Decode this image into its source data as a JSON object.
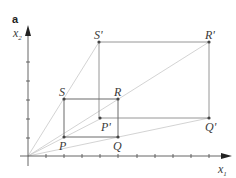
{
  "panel_label": "a",
  "axes": {
    "x_label": "x",
    "x_sub": "1",
    "y_label": "x",
    "y_sub": "2",
    "origin_px": [
      28,
      156
    ],
    "tick_spacing_px": 18.2,
    "x_ticks": 10,
    "y_ticks": 5
  },
  "colors": {
    "axis": "#555555",
    "rect": "#777777",
    "ray": "#c8c8c8",
    "point": "#444444",
    "label": "#3a3a3a"
  },
  "original_rectangle": {
    "points": [
      {
        "name": "P",
        "x": 2,
        "y": 1,
        "label": "P"
      },
      {
        "name": "Q",
        "x": 5,
        "y": 1,
        "label": "Q"
      },
      {
        "name": "R",
        "x": 5,
        "y": 3,
        "label": "R"
      },
      {
        "name": "S",
        "x": 2,
        "y": 3,
        "label": "S"
      }
    ]
  },
  "transformed_rectangle": {
    "points": [
      {
        "name": "P'",
        "x": 4,
        "y": 2,
        "label": "P'"
      },
      {
        "name": "Q'",
        "x": 10,
        "y": 2,
        "label": "Q'"
      },
      {
        "name": "R'",
        "x": 10,
        "y": 6,
        "label": "R'"
      },
      {
        "name": "S'",
        "x": 4,
        "y": 6,
        "label": "S'"
      }
    ]
  }
}
